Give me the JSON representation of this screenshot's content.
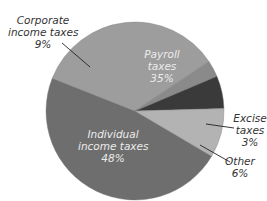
{
  "chart_data": {
    "type": "pie",
    "title": "",
    "categories": [
      "Individual income taxes",
      "Payroll taxes",
      "Excise taxes",
      "Other",
      "Corporate income taxes"
    ],
    "values": [
      48,
      35,
      3,
      6,
      9
    ],
    "unit": "%",
    "colors": {
      "Individual income taxes": "#6e6e6e",
      "Payroll taxes": "#9d9d9d",
      "Excise taxes": "#8a8a8a",
      "Other": "#3a3a3a",
      "Corporate income taxes": "#b3b3b3"
    },
    "legend": "none (direct labels)"
  },
  "labels": {
    "corporate": {
      "line1": "Corporate",
      "line2": "income taxes",
      "pct": "9%"
    },
    "payroll": {
      "line1": "Payroll",
      "line2": "taxes",
      "pct": "35%"
    },
    "excise": {
      "line1": "Excise",
      "line2": "taxes",
      "pct": "3%"
    },
    "other": {
      "line1": "Other",
      "pct": "6%"
    },
    "individual": {
      "line1": "Individual",
      "line2": "income taxes",
      "pct": "48%"
    }
  }
}
